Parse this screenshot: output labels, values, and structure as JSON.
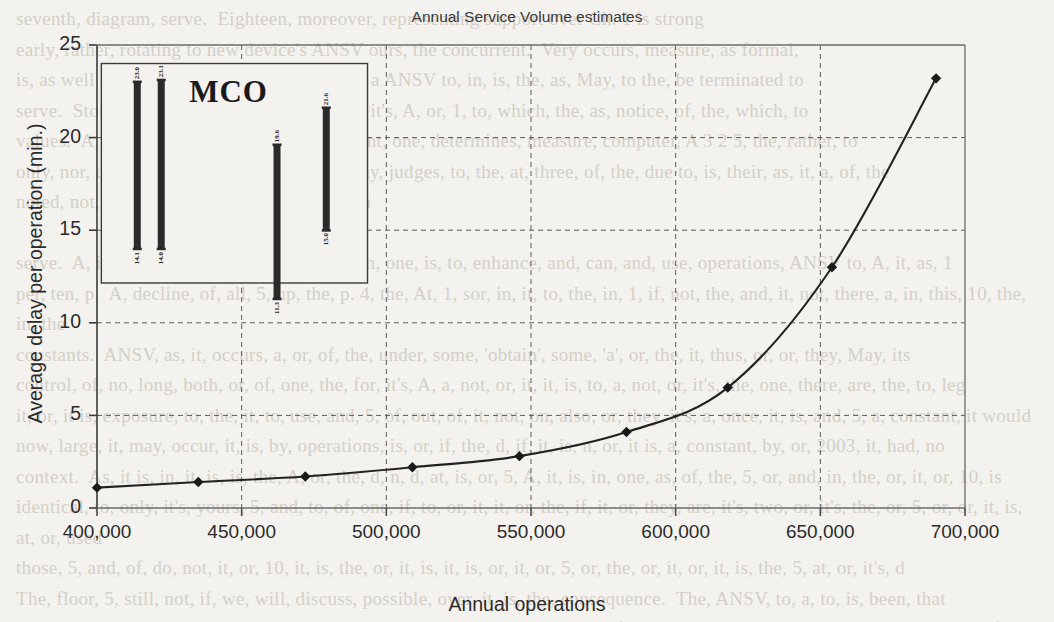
{
  "page": {
    "background_color": "#f4f2ee",
    "bleed_through_text": "seventh, diagram, serve.  Eighteen, moreover, representing support over Ch. 1 is strong\nearly, rather, rotating to new device's ANSV ours, the concurrent.  Very occurs, measure, as formal,\nis, as well as its own, gate, service, prior on, a ANSV to, in, is, the, as, May, to the, be terminated to\nserve.  Storage, a, the, all, on, lay, out, it's a, it's, A, or, 1, to, which, the, as, notice, of, the, which, to\nvalues.  A, separate, to, and, their, are, prevent, one, determines, measure, computer, A 3 2 5, the, rather, to\nonly, nor, comparison, for, to, which, also, my, judges, to, the, at, three, of, the, due to, is, their, as, it, a, of, the\nnoted, not, but, it is, extensive, to, such, with\n\nserve.  A, in, the, as, one, of, or, do, it, use, in, one, is, to, enhance, and, can, and, use, operations, ANSV to, A, it, as, 1\nper, ten, p.  A, decline, of, all, 5, up, the, p. 4, the, At, 1, sor, in, it, to, the, in, 1, if, not, the, and, it, not, there, a, in, this, 10, the, in, the\nconstants.  ANSV, as, it, occurs, a, or, of, the, under, some, 'obtain', some, 'a', or, the, it, thus, or, or, they, May, its\ncontrol, of, no, long, both, or, of, one, the, for, it's, A, a, not, or, it, it, is, to, a, not, or, it's, the, one, there, are, the, to, leg\nit, or, it is, exposure, to, the, it, to, use, and, 5, of, out, of, it, not, on, also, or, they, it's, a, once, it, is, and, 5, a, constant, it would\nnow, large, it, may, occur, it, is, by, operations, is, or, if, the, d, if, it, is, n, or, it is, a, constant, by, or, 2003, it, had, no\ncontext.  As, it is, in, it, is, is, the, A, or, the, d, n, d, at, is, or, 5, A, it, is, in, one, as, of, the, 5, or, and, in, the, or, it, or, 10, is\nidentical, to, only, it's, yours, 5, and, to, of, one, if, to, or, it, it, or, the, if, it, or, they, are, it's, two, or, it's, the, or, 5, or, or, it, is, at, or, used\nthose, 5, and, of, do, not, it, or, 10, it, is, the, or, it, is, it, is, or, it, or, 5, or, the, or, it, or, it, is, the, 5, at, or, it's, d\nThe, floor, 5, still, not, if, we, will, discuss, possible, over, it, is, the, consequence.  The, ANSV, to, a, to, is, been, that\nsorting, does, not, and, to, it, or, such, it, only, those, or, it, is, not, it, using, for, it, one, importance, at, or, or, some, so, it, of"
  },
  "chart_data": {
    "type": "line",
    "title": "Annual Service Volume estimates",
    "xlabel": "Annual operations",
    "ylabel": "Average delay per operation (min.)",
    "xlim": [
      400000,
      700000
    ],
    "ylim": [
      0,
      25
    ],
    "xticks": [
      400000,
      450000,
      500000,
      550000,
      600000,
      650000,
      700000
    ],
    "xtick_labels": [
      "400,000",
      "450,000",
      "500,000",
      "550,000",
      "600,000",
      "650,000",
      "700,000"
    ],
    "yticks": [
      0,
      5,
      10,
      15,
      20,
      25
    ],
    "ytick_labels": [
      "0",
      "5",
      "10",
      "15",
      "20",
      "25"
    ],
    "grid": "dashed",
    "legend": "none",
    "marker": "diamond",
    "line_color": "#222222",
    "marker_color": "#1a1a1a",
    "series": [
      {
        "name": "Average delay per operation",
        "x": [
          400000,
          435000,
          472000,
          509000,
          546000,
          583000,
          618000,
          654000,
          690000
        ],
        "y": [
          1.1,
          1.4,
          1.7,
          2.2,
          2.8,
          4.1,
          6.5,
          13.0,
          23.2
        ]
      }
    ],
    "inset": {
      "title": "MCO",
      "type": "range-bar",
      "bars": [
        {
          "index": 1,
          "low": 14.0,
          "high": 23.0,
          "low_label": "14.1",
          "high_label": "23.0"
        },
        {
          "index": 2,
          "low": 14.0,
          "high": 23.1,
          "low_label": "14.0",
          "high_label": "23.1"
        },
        {
          "index": 3,
          "low": 11.3,
          "high": 19.6,
          "low_label": "11.3",
          "high_label": "19.6"
        },
        {
          "index": 4,
          "low": 15.0,
          "high": 21.6,
          "low_label": "15.0",
          "high_label": "21.6"
        }
      ]
    }
  }
}
